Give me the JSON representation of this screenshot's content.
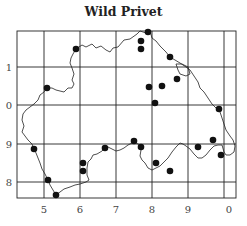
{
  "title": "Wild Privet",
  "map": {
    "frame": {
      "x1": 17,
      "y1": 31,
      "x2": 236,
      "y2": 198
    },
    "grid_x": [
      44,
      80,
      116,
      152,
      188,
      224
    ],
    "grid_y": [
      67,
      105,
      144,
      182
    ],
    "x_labels": [
      {
        "text": "5",
        "x": 44
      },
      {
        "text": "6",
        "x": 80
      },
      {
        "text": "7",
        "x": 116
      },
      {
        "text": "8",
        "x": 152
      },
      {
        "text": "9",
        "x": 188
      },
      {
        "text": "0",
        "x": 229
      }
    ],
    "y_labels": [
      {
        "text": "1",
        "y": 67
      },
      {
        "text": "0",
        "y": 105
      },
      {
        "text": "9",
        "y": 144
      },
      {
        "text": "8",
        "y": 182
      }
    ],
    "record_dots": [
      [
        76,
        49
      ],
      [
        47,
        88
      ],
      [
        148,
        32
      ],
      [
        141,
        41
      ],
      [
        141,
        49
      ],
      [
        170,
        57
      ],
      [
        177,
        79
      ],
      [
        149,
        87
      ],
      [
        162,
        86
      ],
      [
        155,
        103
      ],
      [
        219,
        109
      ],
      [
        34,
        149
      ],
      [
        48,
        180
      ],
      [
        56,
        195
      ],
      [
        83,
        163
      ],
      [
        83,
        171
      ],
      [
        105,
        148
      ],
      [
        134,
        141
      ],
      [
        141,
        147
      ],
      [
        156,
        163
      ],
      [
        170,
        171
      ],
      [
        198,
        147
      ],
      [
        213,
        140
      ],
      [
        221,
        155
      ]
    ],
    "colors": {
      "line": "#222222",
      "dot": "#111111",
      "background": "#ffffff"
    }
  }
}
